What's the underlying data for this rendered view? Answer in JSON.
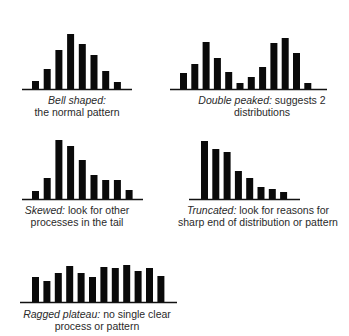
{
  "chart_data": [
    {
      "type": "bar",
      "id": "bell",
      "title": "Bell shaped",
      "caption": {
        "label": "Bell shaped:",
        "lines": [
          "",
          "the normal pattern"
        ]
      },
      "values": [
        8,
        20,
        39,
        55,
        45,
        34,
        18,
        7
      ]
    },
    {
      "type": "bar",
      "id": "double",
      "title": "Double peaked",
      "caption": {
        "label": "Double peaked:",
        "lines": [
          " suggests 2",
          "distributions"
        ]
      },
      "values": [
        16,
        25,
        47,
        31,
        17,
        6,
        12,
        22,
        46,
        51,
        36,
        6
      ]
    },
    {
      "type": "bar",
      "id": "skewed",
      "title": "Skewed",
      "caption": {
        "label": "Skewed:",
        "lines": [
          " look for other",
          "processes in the tail"
        ]
      },
      "values": [
        8,
        21,
        59,
        53,
        39,
        24,
        19,
        19,
        9
      ]
    },
    {
      "type": "bar",
      "id": "truncated",
      "title": "Truncated",
      "caption": {
        "label": "Truncated:",
        "lines": [
          " look for reasons for",
          "sharp end of distribution or pattern"
        ]
      },
      "values": [
        58,
        50,
        47,
        28,
        21,
        12,
        10,
        7
      ]
    },
    {
      "type": "bar",
      "id": "ragged",
      "title": "Ragged plateau",
      "caption": {
        "label": "Ragged plateau:",
        "lines": [
          " no single clear",
          "process or pattern"
        ]
      },
      "values": [
        25,
        21,
        29,
        36,
        29,
        25,
        35,
        34,
        37,
        31,
        34,
        26
      ]
    }
  ],
  "colors": {
    "bar": "#0a0a0a",
    "axis": "#111111",
    "text": "#2a2a2a",
    "background": "#ffffff"
  }
}
